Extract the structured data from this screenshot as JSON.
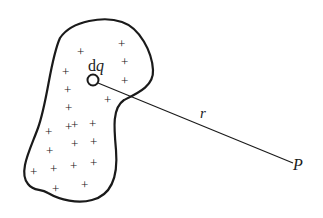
{
  "figure": {
    "labels": {
      "element": "dq",
      "element_d": "d",
      "element_q": "q",
      "distance": "r",
      "point": "P"
    },
    "charge_symbol": "+",
    "charge_count": 22,
    "colors": {
      "ink": "#1a1a1a",
      "background": "#ffffff"
    }
  }
}
